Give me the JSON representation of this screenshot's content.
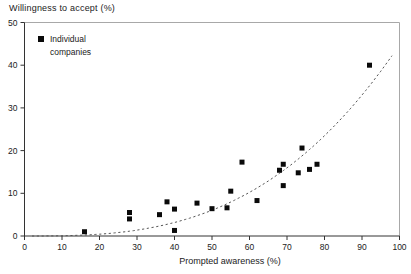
{
  "chart_data": {
    "type": "scatter",
    "title": "Willingness to accept (%)",
    "xlabel": "Prompted awareness (%)",
    "ylabel": "Willingness to accept (%)",
    "xlim": [
      0,
      100
    ],
    "ylim": [
      0,
      50
    ],
    "x_ticks": [
      0,
      10,
      20,
      30,
      40,
      50,
      60,
      70,
      80,
      90,
      100
    ],
    "y_ticks": [
      0,
      10,
      20,
      30,
      40,
      50
    ],
    "grid": false,
    "legend": {
      "position": "top-left",
      "line1": "Individual",
      "line2": "companies",
      "marker": "filled-square"
    },
    "series": [
      {
        "name": "Individual companies",
        "marker": "square",
        "points": [
          [
            16,
            1
          ],
          [
            28,
            4
          ],
          [
            28,
            5.5
          ],
          [
            36,
            5
          ],
          [
            38,
            8
          ],
          [
            40,
            6.3
          ],
          [
            40,
            1.3
          ],
          [
            46,
            7.7
          ],
          [
            50,
            6.4
          ],
          [
            54,
            6.6
          ],
          [
            55,
            10.5
          ],
          [
            58,
            17.3
          ],
          [
            62,
            8.3
          ],
          [
            68,
            15.4
          ],
          [
            69,
            16.8
          ],
          [
            69,
            11.8
          ],
          [
            73,
            14.8
          ],
          [
            74,
            20.6
          ],
          [
            76,
            15.6
          ],
          [
            78,
            16.8
          ],
          [
            92,
            40
          ]
        ]
      }
    ],
    "trend_curve": {
      "type": "power",
      "coef_a": 7.43e-05,
      "exponent": 2.89,
      "x_start": 2,
      "x_end": 98.5,
      "style": "dashed"
    }
  },
  "colors": {
    "background": "#ffffff",
    "marker": "#0a0a0a",
    "axis": "#333333",
    "frame": "#a8a8a8",
    "text": "#222222",
    "curve": "#555555"
  }
}
